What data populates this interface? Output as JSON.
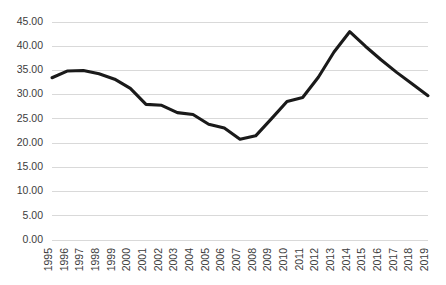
{
  "chart_data": {
    "type": "line",
    "title": "",
    "subtitle": "",
    "xlabel": "",
    "ylabel": "",
    "grid": true,
    "grid_axis": "y",
    "legend": false,
    "legend_position": "none",
    "line_color": "#1a1a1a",
    "gridline_color": "#d9d9d9",
    "tick_label_color": "#3c3c3c",
    "xlim": [
      1995,
      2019
    ],
    "ylim": [
      0,
      45
    ],
    "ytick_step": 5,
    "ytick_labels": [
      "0.00",
      "5.00",
      "10.00",
      "15.00",
      "20.00",
      "25.00",
      "30.00",
      "35.00",
      "40.00",
      "45.00"
    ],
    "ytick_values": [
      0,
      5,
      10,
      15,
      20,
      25,
      30,
      35,
      40,
      45
    ],
    "xtick_rotation": 90,
    "categories": [
      "1995",
      "1996",
      "1997",
      "1998",
      "1999",
      "2000",
      "2001",
      "2002",
      "2003",
      "2004",
      "2005",
      "2006",
      "2007",
      "2008",
      "2009",
      "2010",
      "2011",
      "2012",
      "2013",
      "2014",
      "2015",
      "2016",
      "2017",
      "2018",
      "2019"
    ],
    "x": [
      1995,
      1996,
      1997,
      1998,
      1999,
      2000,
      2001,
      2002,
      2003,
      2004,
      2005,
      2006,
      2007,
      2008,
      2009,
      2010,
      2011,
      2012,
      2013,
      2014,
      2015,
      2016,
      2017,
      2018,
      2019
    ],
    "values": [
      33.5,
      34.9,
      35.0,
      34.3,
      33.2,
      31.3,
      28.0,
      27.8,
      26.3,
      25.9,
      23.9,
      23.1,
      20.8,
      21.5,
      25.0,
      28.6,
      29.4,
      33.6,
      38.8,
      43.0,
      40.0,
      37.2,
      34.6,
      32.2,
      29.8
    ],
    "series": [
      {
        "name": "Series 1",
        "values": [
          33.5,
          34.9,
          35.0,
          34.3,
          33.2,
          31.3,
          28.0,
          27.8,
          26.3,
          25.9,
          23.9,
          23.1,
          20.8,
          21.5,
          25.0,
          28.6,
          29.4,
          33.6,
          38.8,
          43.0,
          40.0,
          37.2,
          34.6,
          32.2,
          29.8
        ]
      }
    ]
  },
  "plot_geometry": {
    "left": 52,
    "right": 428,
    "top": 22,
    "bottom": 240
  }
}
